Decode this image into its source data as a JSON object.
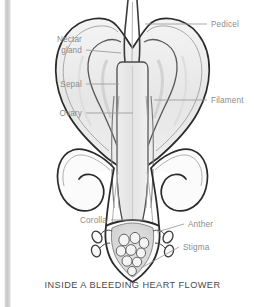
{
  "page": {
    "background_color": "#ffffff",
    "edge_bar_color": "#c8c8c8",
    "clipped_top_text": ""
  },
  "figure": {
    "caption": "INSIDE A BLEEDING HEART FLOWER",
    "caption_color": "#4a4a4a",
    "label_color": "#8c8c8c",
    "outline_color": "#2b2b2b",
    "inner_line_color": "#9a9a9a",
    "fill_light": "#f2f2f2",
    "fill_mid": "#e4e4e4",
    "fill_shadow": "#dcdcdc"
  },
  "labels": [
    {
      "id": "pedicel",
      "text": "Pedicel",
      "side": "right",
      "x": 200,
      "y": 27,
      "anchor": "start"
    },
    {
      "id": "nectar_l1",
      "text": "Nectar",
      "side": "left",
      "x": 71,
      "y": 42,
      "anchor": "end"
    },
    {
      "id": "nectar_l2",
      "text": "gland",
      "side": "left",
      "x": 71,
      "y": 53,
      "anchor": "end"
    },
    {
      "id": "sepal",
      "text": "Sepal",
      "side": "left",
      "x": 71,
      "y": 87,
      "anchor": "end"
    },
    {
      "id": "filament",
      "text": "Filament",
      "side": "right",
      "x": 200,
      "y": 103,
      "anchor": "start"
    },
    {
      "id": "ovary",
      "text": "Ovary",
      "side": "left",
      "x": 71,
      "y": 116,
      "anchor": "end"
    },
    {
      "id": "corolla",
      "text": "Corolla",
      "side": "left",
      "x": 96,
      "y": 223,
      "anchor": "end"
    },
    {
      "id": "anther",
      "text": "Anther",
      "side": "right",
      "x": 177,
      "y": 227,
      "anchor": "start"
    },
    {
      "id": "stigma",
      "text": "Stigma",
      "side": "right",
      "x": 172,
      "y": 250,
      "anchor": "start"
    }
  ],
  "parts": [
    {
      "id": "pedicel",
      "name": "Pedicel",
      "description": "flower stalk entering from top"
    },
    {
      "id": "nectar-gland",
      "name": "Nectar gland",
      "description": "inner curved gland at top of each heart lobe"
    },
    {
      "id": "sepal",
      "name": "Sepal",
      "description": "outer heart-shaped wall"
    },
    {
      "id": "ovary",
      "name": "Ovary",
      "description": "central elongated capsule"
    },
    {
      "id": "filament",
      "name": "Filament",
      "description": "slender stalk beside the ovary"
    },
    {
      "id": "corolla",
      "name": "Corolla",
      "description": "lower petal tube enclosing reproductive parts"
    },
    {
      "id": "anther",
      "name": "Anther",
      "description": "small oval pollen sacs at base"
    },
    {
      "id": "stigma",
      "name": "Stigma",
      "description": "lobed pollen-receiving tip at the very bottom"
    }
  ]
}
